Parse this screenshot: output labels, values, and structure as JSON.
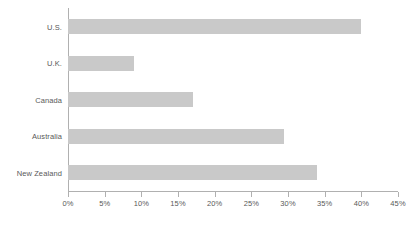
{
  "chart_data": {
    "type": "bar",
    "orientation": "horizontal",
    "title": "",
    "subtitle": "",
    "xlabel": "",
    "ylabel": "",
    "categories": [
      "U.S.",
      "U.K.",
      "Canada",
      "Australia",
      "New Zealand"
    ],
    "values": [
      40,
      9,
      17,
      29.5,
      34
    ],
    "value_suffix": "%",
    "xlim": [
      0,
      45
    ],
    "xticks": [
      0,
      5,
      10,
      15,
      20,
      25,
      30,
      35,
      40,
      45
    ],
    "xtick_labels": [
      "0%",
      "5%",
      "10%",
      "15%",
      "20%",
      "25%",
      "30%",
      "35%",
      "40%",
      "45%"
    ],
    "grid": false,
    "legend": false,
    "legend_position": "none",
    "series": [
      {
        "name": "",
        "values": [
          40,
          9,
          17,
          29.5,
          34
        ]
      }
    ],
    "colors": {
      "bar_fill": "#c9c9c9",
      "axis_line": "#b0b0b0",
      "tick_text": "#595959",
      "category_text": "#595959",
      "background": "#ffffff"
    }
  }
}
